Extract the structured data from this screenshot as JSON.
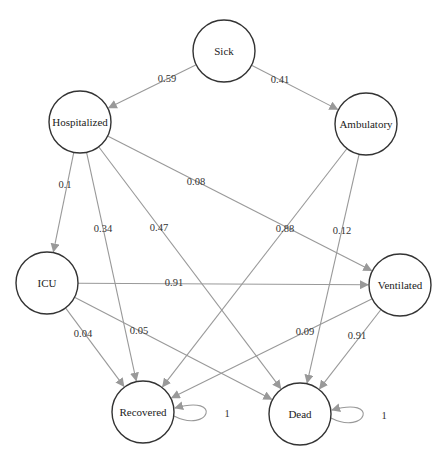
{
  "diagram": {
    "type": "markov-chain",
    "nodes": [
      {
        "id": "sick",
        "label": "Sick",
        "x": 224,
        "y": 51
      },
      {
        "id": "hospitalized",
        "label": "Hospitalized",
        "x": 80,
        "y": 122
      },
      {
        "id": "ambulatory",
        "label": "Ambulatory",
        "x": 366,
        "y": 124
      },
      {
        "id": "icu",
        "label": "ICU",
        "x": 47,
        "y": 283
      },
      {
        "id": "ventilated",
        "label": "Ventilated",
        "x": 400,
        "y": 285
      },
      {
        "id": "recovered",
        "label": "Recovered",
        "x": 143,
        "y": 412
      },
      {
        "id": "dead",
        "label": "Dead",
        "x": 300,
        "y": 414
      }
    ],
    "edges": [
      {
        "from": "sick",
        "to": "hospitalized",
        "label": "0.59",
        "lx": 167,
        "ly": 80
      },
      {
        "from": "sick",
        "to": "ambulatory",
        "label": "0.41",
        "lx": 280,
        "ly": 81
      },
      {
        "from": "hospitalized",
        "to": "icu",
        "label": "0.1",
        "lx": 65,
        "ly": 186
      },
      {
        "from": "hospitalized",
        "to": "ventilated",
        "label": "0.08",
        "lx": 196,
        "ly": 183
      },
      {
        "from": "hospitalized",
        "to": "recovered",
        "label": "0.34",
        "lx": 103,
        "ly": 230
      },
      {
        "from": "hospitalized",
        "to": "dead",
        "label": "0.47",
        "lx": 159,
        "ly": 229
      },
      {
        "from": "ambulatory",
        "to": "recovered",
        "label": "0.88",
        "lx": 285,
        "ly": 230
      },
      {
        "from": "ambulatory",
        "to": "dead",
        "label": "0.12",
        "lx": 342,
        "ly": 232
      },
      {
        "from": "icu",
        "to": "ventilated",
        "label": "0.91",
        "lx": 174,
        "ly": 284
      },
      {
        "from": "icu",
        "to": "recovered",
        "label": "0.04",
        "lx": 83,
        "ly": 335
      },
      {
        "from": "icu",
        "to": "dead",
        "label": "0.05",
        "lx": 139,
        "ly": 332
      },
      {
        "from": "ventilated",
        "to": "recovered",
        "label": "0.09",
        "lx": 305,
        "ly": 333
      },
      {
        "from": "ventilated",
        "to": "dead",
        "label": "0.91",
        "lx": 357,
        "ly": 337
      },
      {
        "from": "recovered",
        "to": "recovered",
        "label": "1",
        "lx": 227,
        "ly": 415
      },
      {
        "from": "dead",
        "to": "dead",
        "label": "1",
        "lx": 384,
        "ly": 417
      }
    ]
  },
  "colors": {
    "edge": "#999999",
    "node_stroke": "#333333",
    "text": "#222222",
    "background": "#ffffff"
  }
}
